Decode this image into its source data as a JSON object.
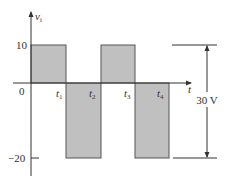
{
  "diagram": {
    "type": "square-wave",
    "y_axis_label": "v",
    "y_axis_label_sub": "i",
    "x_axis_label": "t",
    "y_ticks": [
      {
        "label": "10",
        "value": 10
      },
      {
        "label": "0",
        "value": 0
      },
      {
        "label": "−20",
        "value": -20
      }
    ],
    "time_marks": [
      {
        "label": "t",
        "sub": "1"
      },
      {
        "label": "t",
        "sub": "2"
      },
      {
        "label": "t",
        "sub": "3"
      },
      {
        "label": "t",
        "sub": "4"
      }
    ],
    "segments": [
      {
        "from": "0",
        "to": "t1",
        "level": 10
      },
      {
        "from": "t1",
        "to": "t2",
        "level": -20
      },
      {
        "from": "t2",
        "to": "t3",
        "level": 10
      },
      {
        "from": "t3",
        "to": "t4",
        "level": -20
      }
    ],
    "dimension_label": "30 V",
    "colors": {
      "fill": "#c0c0c0",
      "stroke": "#555555",
      "axis": "#333333"
    }
  }
}
